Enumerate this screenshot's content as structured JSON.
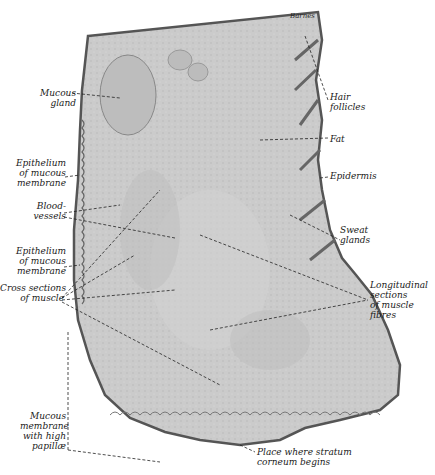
{
  "figure": {
    "signature": "Barnes",
    "colors": {
      "tissue_fill": "#c9c9c9",
      "tissue_light": "#d8d8d8",
      "outline": "#555555",
      "leader_line": "#222222",
      "background": "#ffffff"
    }
  },
  "labels": {
    "left": [
      {
        "id": "mucous-gland",
        "text": "Mucous\ngland",
        "x": 30,
        "y": 88
      },
      {
        "id": "epithelium-upper",
        "text": "Epithelium\nof mucous\nmembrane",
        "x": 8,
        "y": 160
      },
      {
        "id": "blood-vessels",
        "text": "Blood-\nvessels",
        "x": 32,
        "y": 203
      },
      {
        "id": "epithelium-lower",
        "text": "Epithelium\nof mucous\nmembrane",
        "x": 8,
        "y": 250
      },
      {
        "id": "cross-sections-muscle",
        "text": "Cross sections\nof muscle",
        "x": 4,
        "y": 287
      },
      {
        "id": "mucous-membrane-papillae",
        "text": "Mucous\nmembrane\nwith high\npapillæ",
        "x": 26,
        "y": 413
      }
    ],
    "right": [
      {
        "id": "hair-follicles",
        "text": "Hair\nfollicles",
        "x": 330,
        "y": 95
      },
      {
        "id": "fat",
        "text": "Fat",
        "x": 330,
        "y": 135
      },
      {
        "id": "epidermis",
        "text": "Epidermis",
        "x": 330,
        "y": 172
      },
      {
        "id": "sweat-glands",
        "text": "Sweat\nglands",
        "x": 340,
        "y": 226
      },
      {
        "id": "longitudinal-sections",
        "text": "Longitudinal\nsections\nof muscle\nfibres",
        "x": 370,
        "y": 280
      },
      {
        "id": "stratum-corneum",
        "text": "Place where stratum\ncorneum begins",
        "x": 257,
        "y": 448
      }
    ]
  }
}
